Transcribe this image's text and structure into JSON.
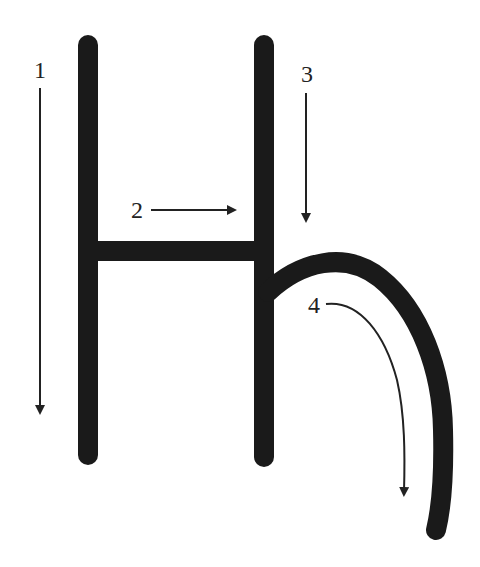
{
  "diagram": {
    "colors": {
      "stroke": "#1a1a1a",
      "arrow": "#222222",
      "background": "#ffffff"
    },
    "strokes": [
      {
        "id": 1,
        "label": "1",
        "description": "left vertical stroke, drawn top to bottom"
      },
      {
        "id": 2,
        "label": "2",
        "description": "horizontal crossbar, drawn left to right"
      },
      {
        "id": 3,
        "label": "3",
        "description": "right vertical stroke, drawn top to bottom"
      },
      {
        "id": 4,
        "label": "4",
        "description": "curved hook from the right stroke, arcing right and down"
      }
    ]
  }
}
